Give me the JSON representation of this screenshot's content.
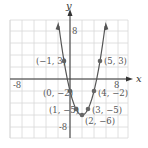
{
  "chart_data": {
    "type": "line",
    "title": "",
    "xlabel": "x",
    "ylabel": "y",
    "xlim": [
      -10,
      10
    ],
    "ylim": [
      -10,
      10
    ],
    "grid": true,
    "grid_step": 2,
    "tick_labels": {
      "x": [
        "-8",
        "8"
      ],
      "y": [
        "8",
        "-8"
      ]
    },
    "function": "y = x^2 - 4x - 2",
    "series": [
      {
        "name": "parabola",
        "points": [
          {
            "x": -1,
            "y": 3,
            "label": "(−1, 3)"
          },
          {
            "x": 0,
            "y": -2,
            "label": "(0, −2)"
          },
          {
            "x": 1,
            "y": -5,
            "label": "(1, −5)"
          },
          {
            "x": 2,
            "y": -6,
            "label": "(2, −6)"
          },
          {
            "x": 3,
            "y": -5,
            "label": "(3, −5)"
          },
          {
            "x": 4,
            "y": -2,
            "label": "(4, −2)"
          },
          {
            "x": 5,
            "y": 3,
            "label": "(5, 3)"
          }
        ]
      }
    ],
    "colors": {
      "curve": "#555555",
      "points": "#666666",
      "grid": "#d8d8d8",
      "axes": "#333333"
    }
  }
}
